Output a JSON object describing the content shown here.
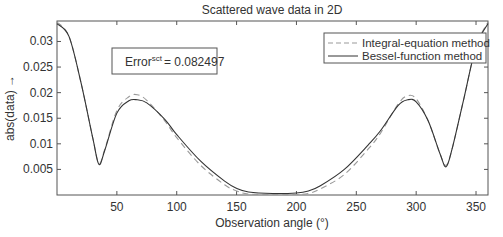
{
  "chart_data": {
    "type": "line",
    "title": "Scattered wave data in 2D",
    "xlabel": "Observation angle (°)",
    "ylabel": "abs(data) →",
    "xlim": [
      0,
      360
    ],
    "ylim": [
      0,
      0.034
    ],
    "xticks": [
      50,
      100,
      150,
      200,
      250,
      300,
      350
    ],
    "yticks": [
      0.005,
      0.01,
      0.015,
      0.02,
      0.025,
      0.03
    ],
    "ytick_labels": [
      "0.005",
      "0.01",
      "0.015",
      "0.02",
      "0.025",
      "0.03"
    ],
    "grid": false,
    "legend_position": "upper right",
    "annotation": {
      "base": "Error",
      "sup": "sct",
      "value": "= 0.082497"
    },
    "x": [
      0,
      10,
      20,
      30,
      35,
      40,
      50,
      60,
      67,
      75,
      90,
      100,
      120,
      140,
      150,
      160,
      180,
      200,
      210,
      220,
      240,
      260,
      270,
      285,
      293,
      300,
      310,
      320,
      325,
      330,
      340,
      350,
      360
    ],
    "series": [
      {
        "name": "Integral-equation method",
        "style": "dashed",
        "values": [
          0.0338,
          0.031,
          0.022,
          0.011,
          0.0062,
          0.009,
          0.0165,
          0.0192,
          0.0196,
          0.0185,
          0.0145,
          0.0112,
          0.0058,
          0.002,
          0.0008,
          0.0002,
          0.0001,
          0.0001,
          0.0003,
          0.0012,
          0.004,
          0.009,
          0.012,
          0.0178,
          0.0194,
          0.0188,
          0.0145,
          0.008,
          0.0058,
          0.009,
          0.019,
          0.029,
          0.0338
        ]
      },
      {
        "name": "Bessel-function method",
        "style": "solid",
        "values": [
          0.0335,
          0.031,
          0.022,
          0.011,
          0.006,
          0.0088,
          0.016,
          0.0184,
          0.0186,
          0.018,
          0.0148,
          0.0118,
          0.0066,
          0.0027,
          0.0013,
          0.0006,
          0.0003,
          0.0004,
          0.0008,
          0.0018,
          0.005,
          0.0098,
          0.0125,
          0.0175,
          0.0186,
          0.0182,
          0.0145,
          0.008,
          0.0055,
          0.009,
          0.019,
          0.029,
          0.0335
        ]
      }
    ]
  }
}
